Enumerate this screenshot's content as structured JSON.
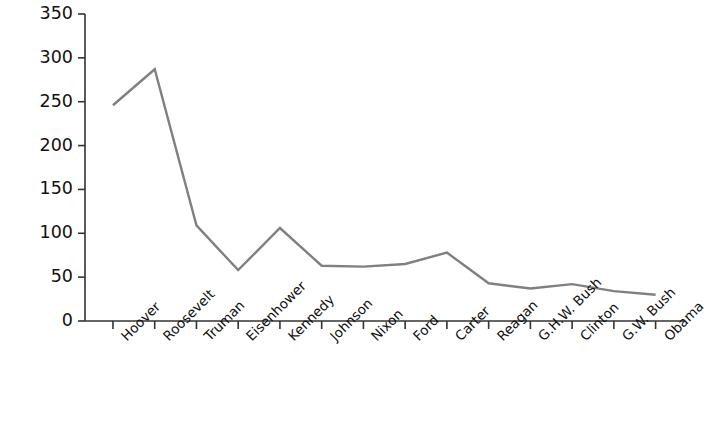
{
  "chart_data": {
    "type": "line",
    "title": "",
    "subtitle": "",
    "xlabel": "",
    "ylabel": "",
    "categories": [
      "Hoover",
      "Roosevelt",
      "Truman",
      "Eisenhower",
      "Kennedy",
      "Johnson",
      "Nixon",
      "Ford",
      "Carter",
      "Reagan",
      "G.H.W. Bush",
      "Clinton",
      "G.W. Bush",
      "Obama"
    ],
    "values": [
      246,
      287,
      109,
      58,
      106,
      63,
      62,
      65,
      78,
      43,
      37,
      42,
      34,
      30
    ],
    "series": [
      {
        "name": "",
        "values": [
          246,
          287,
          109,
          58,
          106,
          63,
          62,
          65,
          78,
          43,
          37,
          42,
          34,
          30
        ],
        "color": "#808080"
      }
    ],
    "ylim": [
      0,
      350
    ],
    "yticks": [
      0,
      50,
      100,
      150,
      200,
      250,
      300,
      350
    ],
    "ytick_labels": [
      "0",
      "50",
      "100",
      "150",
      "200",
      "250",
      "300",
      "350"
    ],
    "xtick_labels": [
      "Hoover",
      "Roosevelt",
      "Truman",
      "Eisenhower",
      "Kennedy",
      "Johnson",
      "Nixon",
      "Ford",
      "Carter",
      "Reagan",
      "G.H.W. Bush",
      "Clinton",
      "G.W. Bush",
      "Obama"
    ],
    "grid": false,
    "legend": false,
    "legend_position": "none",
    "xlabel_rotation": -45,
    "line_color": "#808080",
    "axis_color": "#333333",
    "background_color": "#ffffff"
  }
}
